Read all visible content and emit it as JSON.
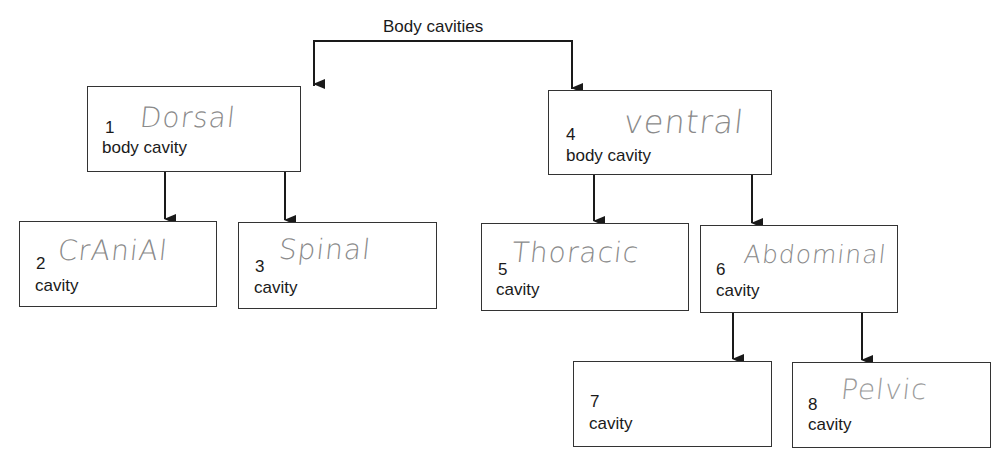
{
  "diagram": {
    "title": "Body cavities",
    "boxes": [
      {
        "id": 1,
        "number": "1",
        "answer": "Dorsal",
        "label": "body cavity"
      },
      {
        "id": 2,
        "number": "2",
        "answer": "CrAniAl",
        "label": "cavity"
      },
      {
        "id": 3,
        "number": "3",
        "answer": "Spinal",
        "label": "cavity"
      },
      {
        "id": 4,
        "number": "4",
        "answer": "ventral",
        "label": "body cavity"
      },
      {
        "id": 5,
        "number": "5",
        "answer": "Thoracic",
        "label": "cavity"
      },
      {
        "id": 6,
        "number": "6",
        "answer": "Abdominal",
        "label": "cavity"
      },
      {
        "id": 7,
        "number": "7",
        "answer": "",
        "label": "cavity"
      },
      {
        "id": 8,
        "number": "8",
        "answer": "Pelvic",
        "label": "cavity"
      }
    ],
    "edges": [
      {
        "from": "title",
        "to": 1
      },
      {
        "from": "title",
        "to": 4
      },
      {
        "from": 1,
        "to": 2
      },
      {
        "from": 1,
        "to": 3
      },
      {
        "from": 4,
        "to": 5
      },
      {
        "from": 4,
        "to": 6
      },
      {
        "from": 6,
        "to": 7
      },
      {
        "from": 6,
        "to": 8
      }
    ],
    "colors": {
      "line": "#1a1a1a",
      "handwriting": "#8a8a8a"
    }
  }
}
